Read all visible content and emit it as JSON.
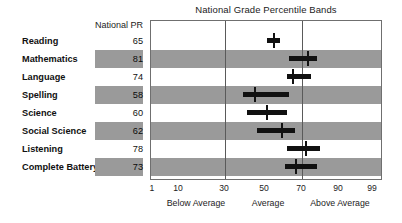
{
  "chart_data": {
    "type": "bar",
    "title": "National Grade Percentile Bands",
    "subtitle": "",
    "xlabel": "",
    "ylabel": "",
    "column_header": "National PR",
    "xlim": [
      1,
      99
    ],
    "grid": true,
    "gridlines": [
      30,
      70
    ],
    "legend": "none",
    "xticks": [
      1,
      10,
      30,
      50,
      70,
      90,
      99
    ],
    "xtick_labels": [
      "1",
      "10",
      "30",
      "50",
      "70",
      "90",
      "99"
    ],
    "xtick_positions_px": [
      152,
      178,
      224,
      264,
      301,
      338,
      372
    ],
    "categories": [
      "Reading",
      "Mathematics",
      "Language",
      "Spelling",
      "Science",
      "Social Science",
      "Listening",
      "Complete Battery"
    ],
    "values": [
      65,
      81,
      74,
      58,
      60,
      62,
      78,
      73
    ],
    "bands": [
      {
        "subject": "Reading",
        "national_pr": 65,
        "band_low": 51,
        "band_high": 58,
        "marker": 55,
        "shaded": false
      },
      {
        "subject": "Mathematics",
        "national_pr": 81,
        "band_low": 63,
        "band_high": 78,
        "marker": 73,
        "shaded": true
      },
      {
        "subject": "Language",
        "national_pr": 74,
        "band_low": 62,
        "band_high": 75,
        "marker": 65,
        "shaded": false
      },
      {
        "subject": "Spelling",
        "national_pr": 58,
        "band_low": 39,
        "band_high": 63,
        "marker": 45,
        "shaded": true
      },
      {
        "subject": "Science",
        "national_pr": 60,
        "band_low": 41,
        "band_high": 62,
        "marker": 51,
        "shaded": false
      },
      {
        "subject": "Social Science",
        "national_pr": 62,
        "band_low": 46,
        "band_high": 66,
        "marker": 59,
        "shaded": true
      },
      {
        "subject": "Listening",
        "national_pr": 78,
        "band_low": 62,
        "band_high": 80,
        "marker": 72,
        "shaded": false
      },
      {
        "subject": "Complete Battery",
        "national_pr": 73,
        "band_low": 61,
        "band_high": 78,
        "marker": 67,
        "shaded": true
      }
    ],
    "category_labels": [
      "Below Average",
      "Average",
      "Above Average"
    ],
    "category_label_positions_px": [
      196,
      268,
      340
    ],
    "colors": {
      "bar": "#111111",
      "stripe": "#9a9a9a",
      "gridline": "#5a5a5a",
      "border": "#6f6f6f",
      "background": "#ffffff",
      "text": "#1c1c1c"
    }
  }
}
